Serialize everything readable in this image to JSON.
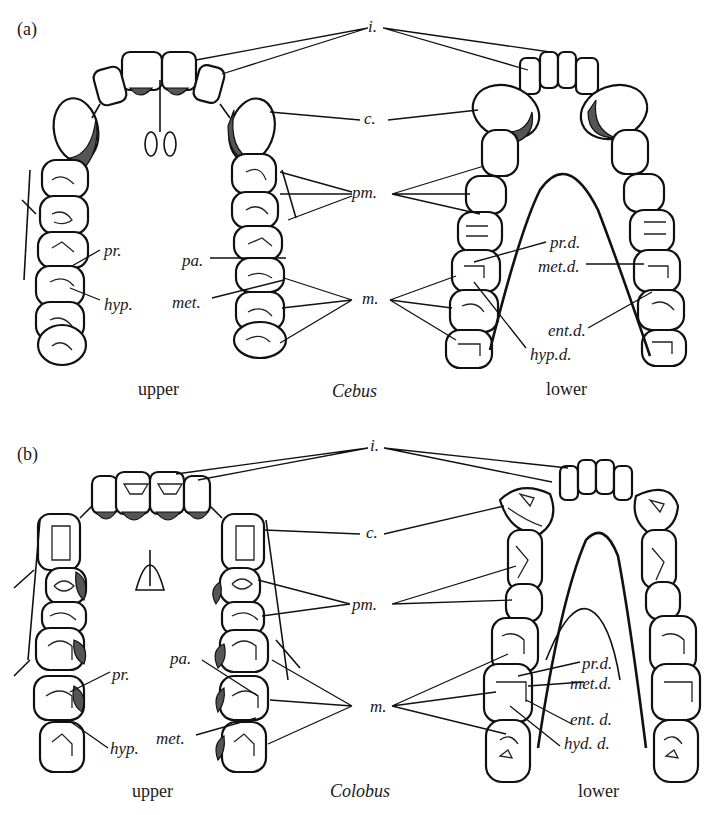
{
  "figure": {
    "panel_a": {
      "panel_label": "(a)",
      "genus": "Cebus",
      "upper_caption": "upper",
      "lower_caption": "lower",
      "labels": {
        "incisors": "i.",
        "canine": "c.",
        "premolars": "pm.",
        "molars": "m.",
        "protocone": "pr.",
        "hypocone": "hyp.",
        "paracone": "pa.",
        "metacone": "met.",
        "protoconid": "pr.d.",
        "metaconid": "met.d.",
        "entoconid": "ent.d.",
        "hypoconid": "hyp.d."
      }
    },
    "panel_b": {
      "panel_label": "(b)",
      "genus": "Colobus",
      "upper_caption": "upper",
      "lower_caption": "lower",
      "labels": {
        "incisors": "i.",
        "canine": "c.",
        "premolars": "pm.",
        "molars": "m.",
        "protocone": "pr.",
        "hypocone": "hyp.",
        "paracone": "pa.",
        "metacone": "met.",
        "protoconid": "pr.d.",
        "metaconid": "met.d.",
        "entoconid": "ent. d.",
        "hypoconid": "hyd. d."
      }
    }
  }
}
